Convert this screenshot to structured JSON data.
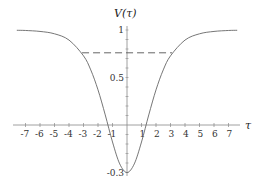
{
  "chart_data": {
    "type": "line",
    "title": "",
    "xlabel": "τ",
    "ylabel": "V(τ)",
    "xlim": [
      -7.6,
      7.6
    ],
    "ylim": [
      -0.5,
      1
    ],
    "grid": false,
    "legend": null,
    "x_ticks": [
      -7,
      -6,
      -5,
      -4,
      -3,
      -2,
      -1,
      1,
      2,
      3,
      4,
      5,
      6,
      7
    ],
    "y_ticks": [
      {
        "value": 1,
        "label": "1"
      },
      {
        "value": 0.5,
        "label": "0.5"
      },
      {
        "value": -0.5,
        "label": "-0.3"
      }
    ],
    "series": [
      {
        "name": "V(τ)",
        "x": [
          -7.6,
          -7,
          -6,
          -5,
          -4,
          -3,
          -2.5,
          -2,
          -1.5,
          -1,
          -0.5,
          0,
          0.5,
          1,
          1.5,
          2,
          2.5,
          3,
          4,
          5,
          6,
          7,
          7.6
        ],
        "values": [
          0.997,
          0.995,
          0.985,
          0.96,
          0.894,
          0.728,
          0.58,
          0.37,
          0.106,
          -0.179,
          -0.41,
          -0.5,
          -0.41,
          -0.179,
          0.106,
          0.37,
          0.58,
          0.728,
          0.894,
          0.96,
          0.985,
          0.995,
          0.997
        ]
      }
    ],
    "annotations": [
      {
        "type": "hline-dashed",
        "y": 0.76,
        "x_from": -3.1,
        "x_to": 3.1
      }
    ]
  },
  "labels": {
    "x_axis": "τ",
    "y_axis": "V(τ)"
  }
}
